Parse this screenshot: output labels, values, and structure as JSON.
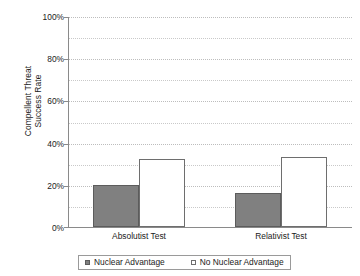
{
  "chart_data": {
    "type": "bar",
    "title": "",
    "xlabel": "",
    "ylabel": "Compellent Threat Success Rate",
    "ylabel_line1": "Compellent Threat",
    "ylabel_line2": "Success Rate",
    "categories": [
      "Absolutist Test",
      "Relativist Test"
    ],
    "series": [
      {
        "name": "Nuclear Advantage",
        "values": [
          20,
          16
        ],
        "fill": "#808080",
        "style": "filled"
      },
      {
        "name": "No Nuclear Advantage",
        "values": [
          32,
          33
        ],
        "fill": "#ffffff",
        "style": "open"
      }
    ],
    "ylim": [
      0,
      100
    ],
    "y_major_ticks": [
      0,
      20,
      40,
      60,
      80,
      100
    ],
    "y_tick_labels": [
      "0%",
      "20%",
      "40%",
      "60%",
      "80%",
      "100%"
    ],
    "y_minor_ticks": [
      10,
      30,
      50,
      70,
      90
    ],
    "grid": "horizontal-dotted",
    "legend_position": "bottom",
    "value_suffix": "%"
  },
  "legend": {
    "items": [
      {
        "label": "Nuclear Advantage",
        "style": "filled"
      },
      {
        "label": "No Nuclear Advantage",
        "style": "open"
      }
    ]
  }
}
